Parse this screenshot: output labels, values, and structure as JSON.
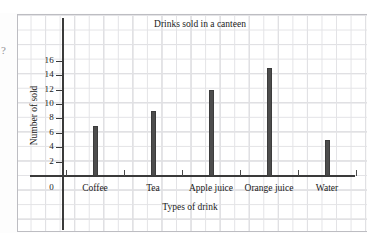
{
  "chart_data": {
    "type": "bar",
    "title": "Drinks sold in a canteen",
    "xlabel": "Types of drink",
    "ylabel": "Number of sold",
    "categories": [
      "Coffee",
      "Tea",
      "Apple juice",
      "Orange juice",
      "Water"
    ],
    "values": [
      7,
      9,
      12,
      15,
      5
    ],
    "yticks": [
      0,
      2,
      4,
      6,
      8,
      10,
      12,
      14,
      16
    ],
    "ylim": [
      0,
      17
    ],
    "grid": true,
    "legend": null,
    "bar_color": "#4d4d4d",
    "axis_color": "#3a3a3a",
    "grid_color": "#c9c9cd"
  },
  "annotations": {
    "edge_mark": "?"
  }
}
